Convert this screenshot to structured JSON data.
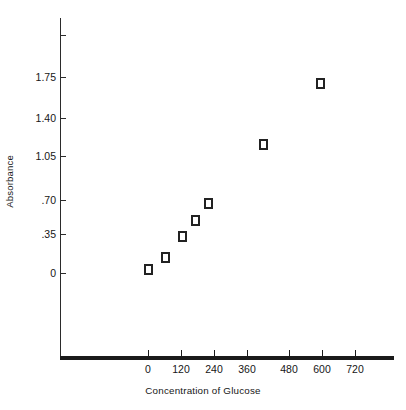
{
  "chart_data": {
    "type": "scatter",
    "title": "",
    "xlabel": "Concentration of Glucose",
    "ylabel": "Absorbance",
    "xlim": [
      -50,
      780
    ],
    "ylim": [
      -0.5,
      2.1
    ],
    "grid": false,
    "legend": "none",
    "marker_style": "open-square",
    "x_ticks": [
      0,
      120,
      240,
      360,
      480,
      600,
      720
    ],
    "x_tick_labels": [
      "0",
      "120",
      "240",
      "360",
      "480",
      "600",
      "720"
    ],
    "y_ticks": [
      0,
      0.35,
      0.7,
      1.05,
      1.4,
      1.75
    ],
    "y_tick_labels": [
      "0",
      ".35",
      ".70",
      "1.05",
      "1.40",
      "1.75"
    ],
    "x": [
      0,
      60,
      120,
      165,
      210,
      400,
      600
    ],
    "y": [
      0.03,
      0.14,
      0.33,
      0.47,
      0.62,
      1.15,
      1.69
    ],
    "points": [
      {
        "x": 0,
        "y": 0.03
      },
      {
        "x": 60,
        "y": 0.14
      },
      {
        "x": 120,
        "y": 0.33
      },
      {
        "x": 165,
        "y": 0.47
      },
      {
        "x": 210,
        "y": 0.62
      },
      {
        "x": 400,
        "y": 1.15
      },
      {
        "x": 600,
        "y": 1.69
      }
    ],
    "series": [
      {
        "name": "Absorbance vs Concentration",
        "values": [
          0.03,
          0.14,
          0.33,
          0.47,
          0.62,
          1.15,
          1.69
        ]
      }
    ],
    "colors": {
      "marker_edge": "#222222",
      "marker_fill": "#ffffff",
      "axis": "#1a1a1a",
      "text": "#161616",
      "background": "#ffffff"
    }
  },
  "axes": {
    "y_labels": [
      {
        "text": "1.75"
      },
      {
        "text": "1.40"
      },
      {
        "text": "1.05"
      },
      {
        "text": ".70"
      },
      {
        "text": ".35"
      },
      {
        "text": "0"
      }
    ],
    "x_labels": [
      {
        "text": "0"
      },
      {
        "text": "120"
      },
      {
        "text": "240"
      },
      {
        "text": "360"
      },
      {
        "text": "480"
      },
      {
        "text": "600"
      },
      {
        "text": "720"
      }
    ],
    "y_title": "Absorbance",
    "x_title": "Concentration of Glucose"
  }
}
